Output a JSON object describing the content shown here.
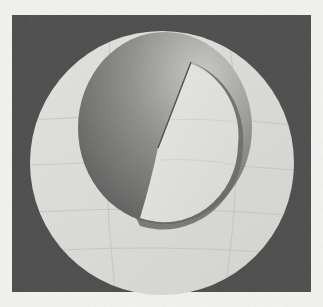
{
  "figure": {
    "width": 323,
    "height": 307,
    "page_background": "#f2f2ef",
    "frame": {
      "x": 12,
      "y": 15,
      "width": 299,
      "height": 277,
      "color": "#4b4b4b"
    },
    "outer_disc": {
      "cx": 162,
      "cy": 163,
      "r": 132,
      "color": "#dadad6",
      "grid_color": "#b9b9b4"
    },
    "sphere": {
      "cx": 165,
      "cy": 122,
      "r": 88,
      "dark_color": "#5c5c5c",
      "mid_color": "#8a8a88",
      "light_color": "#c4c4c0"
    },
    "cutaway": {
      "center": [
        158,
        148
      ],
      "notch": [
        191,
        62
      ],
      "color": "#e4e4e0",
      "shadow_color": "#6a6a68"
    }
  }
}
